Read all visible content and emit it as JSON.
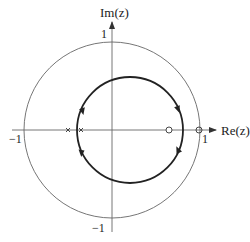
{
  "figure": {
    "type": "root-locus-z-plane",
    "axes": {
      "x_label": "Re(z)",
      "y_label": "Im(z)",
      "x_ticks": [
        "−1",
        "1"
      ],
      "y_ticks": [
        "1",
        "−1"
      ]
    },
    "unit_circle": {
      "radius": 1
    },
    "poles": [
      -0.5,
      -0.35
    ],
    "zeros": [
      0.65,
      1.0
    ],
    "locus": {
      "shape": "circle",
      "center_re": 0.2,
      "radius": 0.6,
      "direction_arrows": [
        "upper-left",
        "upper-right",
        "lower-left",
        "lower-right"
      ]
    },
    "colors": {
      "axes": "#555555",
      "unit_circle": "#666666",
      "locus": "#222222",
      "markers": "#333333"
    }
  }
}
